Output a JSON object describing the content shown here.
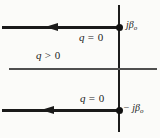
{
  "figure": {
    "type": "s-plane-pole-diagram",
    "colors": {
      "background": "#fbfbf9",
      "line": "#1a1a1a",
      "axis": "#4f4f4f"
    },
    "labels": {
      "top_pole": {
        "main": "jβ",
        "sub": "o"
      },
      "bottom_pole": {
        "main": "− jβ",
        "sub": "o"
      },
      "top_boundary": {
        "var": "q",
        "rest": " = 0"
      },
      "region": {
        "var": "q",
        "rest": " > 0"
      },
      "bottom_boundary": {
        "var": "q",
        "rest": " = 0"
      }
    },
    "icons": {
      "top_arrow": "arrowhead-left",
      "bottom_arrow": "arrowhead-left"
    }
  }
}
